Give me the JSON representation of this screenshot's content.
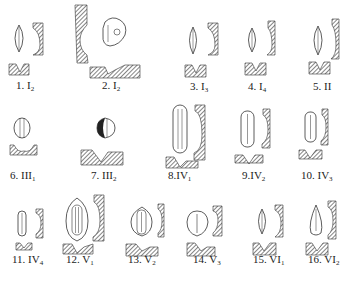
{
  "figure": {
    "type": "stomata-type-diagram",
    "panels": [
      {
        "num": "1.",
        "roman": "I",
        "sub": "2",
        "label": "1. I2"
      },
      {
        "num": "2.",
        "roman": "I",
        "sub": "2",
        "label": "2. I2"
      },
      {
        "num": "3.",
        "roman": "I",
        "sub": "3",
        "label": "3. I3"
      },
      {
        "num": "4.",
        "roman": "I",
        "sub": "4",
        "label": "4. I4"
      },
      {
        "num": "5.",
        "roman": "II",
        "sub": "",
        "label": "5. II"
      },
      {
        "num": "6.",
        "roman": "III",
        "sub": "1",
        "label": "6. III1"
      },
      {
        "num": "7.",
        "roman": "III",
        "sub": "2",
        "label": "7. III2"
      },
      {
        "num": "8.",
        "roman": "IV",
        "sub": "1",
        "label": "8. IV1"
      },
      {
        "num": "9.",
        "roman": "IV",
        "sub": "2",
        "label": "9. IV2"
      },
      {
        "num": "10.",
        "roman": "IV",
        "sub": "3",
        "label": "10. IV3"
      },
      {
        "num": "11.",
        "roman": "IV",
        "sub": "4",
        "label": "11. IV4"
      },
      {
        "num": "12.",
        "roman": "V",
        "sub": "1",
        "label": "12. V1"
      },
      {
        "num": "13.",
        "roman": "V",
        "sub": "2",
        "label": "13. V2"
      },
      {
        "num": "14.",
        "roman": "V",
        "sub": "3",
        "label": "14. V3"
      },
      {
        "num": "15.",
        "roman": "VI",
        "sub": "1",
        "label": "15. VI1"
      },
      {
        "num": "16.",
        "roman": "VI",
        "sub": "2",
        "label": "16. VI2"
      }
    ]
  }
}
